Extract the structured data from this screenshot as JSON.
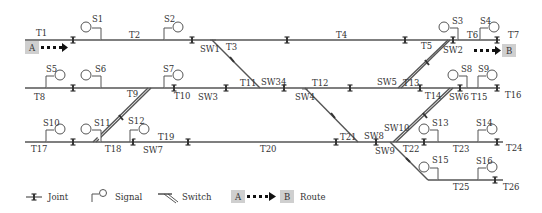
{
  "tracks": [
    "T1",
    "T2",
    "T3",
    "T4",
    "T5",
    "T6",
    "T7",
    "T8",
    "T9",
    "T10",
    "T11",
    "T12",
    "T13",
    "T14",
    "T15",
    "T16",
    "T17",
    "T18",
    "T19",
    "T20",
    "T21",
    "T22",
    "T23",
    "T24",
    "T25",
    "T26"
  ],
  "signals": [
    "S1",
    "S2",
    "S3",
    "S4",
    "S5",
    "S6",
    "S7",
    "S8",
    "S9",
    "S10",
    "S11",
    "S12",
    "S13",
    "S14",
    "S15",
    "S16"
  ],
  "switches": [
    "SW1",
    "SW2",
    "SW3",
    "SW34",
    "SW4",
    "SW5",
    "SW6",
    "SW7",
    "SW8",
    "SW9",
    "SW10"
  ],
  "route": {
    "start": "A",
    "end": "B"
  },
  "legend": {
    "joint": "Joint",
    "signal": "Signal",
    "switch": "Switch",
    "route": "Route",
    "route_start": "A",
    "route_end": "B"
  },
  "colors": {
    "track": "#555555",
    "route_box": "#cfcfcf",
    "text": "#333333"
  }
}
